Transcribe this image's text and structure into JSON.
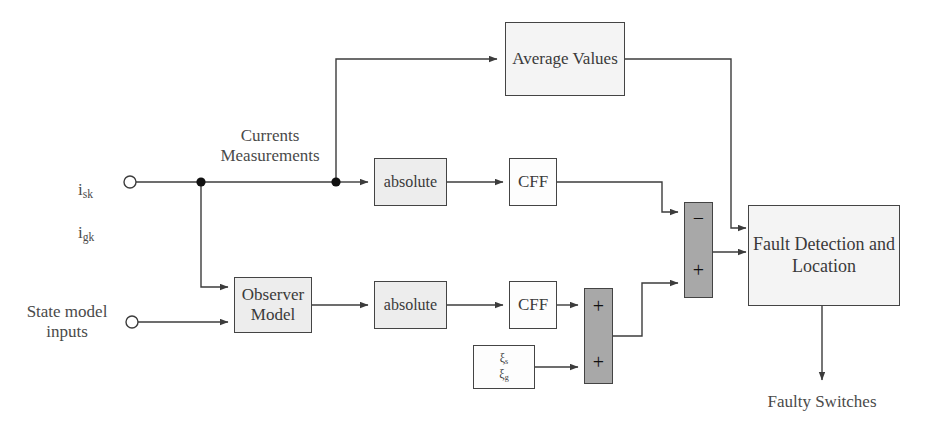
{
  "diagram": {
    "colors": {
      "line": "#3c3c3c",
      "block_border": "#444444",
      "fill_light": "#ededed",
      "fill_very_light": "#f4f4f4",
      "fill_dark": "#a8a8a8",
      "fill_white": "#fdfdfd",
      "text": "#3a3a3a",
      "background": "#ffffff"
    },
    "inputs": [
      {
        "id": "currents",
        "label_line1": "i",
        "label_sub1": "sk",
        "label_line2": "i",
        "label_sub2": "gk",
        "terminal": "open-circle"
      },
      {
        "id": "state-model",
        "label": "State model\ninputs",
        "terminal": "open-circle"
      }
    ],
    "annotations": [
      {
        "id": "currents-measurements",
        "text": "Currents\nMeasurements"
      },
      {
        "id": "faulty-switches",
        "text": "Faulty Switches"
      }
    ],
    "blocks": [
      {
        "id": "average-values",
        "label": "Average\nValues",
        "fill": "very-light"
      },
      {
        "id": "absolute-top",
        "label": "absolute",
        "fill": "light"
      },
      {
        "id": "cff-top",
        "label": "CFF",
        "fill": "white"
      },
      {
        "id": "observer-model",
        "label": "Observer\nModel",
        "fill": "light"
      },
      {
        "id": "absolute-bottom",
        "label": "absolute",
        "fill": "light"
      },
      {
        "id": "cff-bottom",
        "label": "CFF",
        "fill": "white"
      },
      {
        "id": "xi-block",
        "label_line1": "ξ",
        "label_sub1": "s",
        "label_line2": "ξ",
        "label_sub2": "g",
        "fill": "white"
      },
      {
        "id": "fault-detection",
        "label": "Fault Detection\nand Location",
        "fill": "very-light"
      }
    ],
    "summers": [
      {
        "id": "summer-upper",
        "fill": "dark",
        "signs": [
          "−",
          "+"
        ]
      },
      {
        "id": "summer-lower",
        "fill": "dark",
        "signs": [
          "+",
          "+"
        ]
      }
    ]
  }
}
